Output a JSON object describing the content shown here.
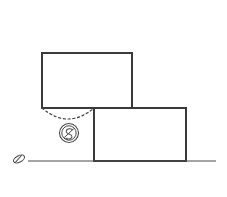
{
  "figure": {
    "type": "mechanics-line-diagram",
    "title": "",
    "canvas": {
      "width": 227,
      "height": 197,
      "background": "#ffffff"
    },
    "style": {
      "line_color": "#3a3a3a",
      "solid_stroke_width": 1.6,
      "thin_stroke_width": 1.1,
      "dashed_stroke_width": 1.2,
      "dash_pattern": "2.2 2.6",
      "marker_color": "#4a4a4a"
    },
    "elements": {
      "upper_block": {
        "label": "upper block",
        "shape": "rectangle",
        "x": 42,
        "y": 53,
        "width": 90,
        "height": 55
      },
      "lower_block": {
        "label": "lower block",
        "shape": "rectangle",
        "x": 94,
        "y": 108,
        "width": 92,
        "height": 53
      },
      "ground_line": {
        "label": "ground line",
        "shape": "line",
        "x1": 28,
        "y1": 161,
        "x2": 216,
        "y2": 161
      },
      "ground_marker": {
        "label": "ground hatch marker",
        "shape": "ellipse-slash",
        "cx": 19,
        "cy": 159,
        "rx": 6,
        "ry": 3.2,
        "rotation": -28
      },
      "dashed_arc": {
        "label": "dashed trajectory arc",
        "shape": "quadratic-curve",
        "start_x": 42,
        "start_y": 108,
        "control_x": 68,
        "control_y": 130,
        "end_x": 94,
        "end_y": 108
      },
      "cg_symbol": {
        "label": "circled center of gravity symbol",
        "shape": "circle-with-glyph",
        "cx": 69,
        "cy": 133,
        "r": 9.5,
        "inner_r": 7.2,
        "glyph": "S-slash"
      }
    }
  }
}
